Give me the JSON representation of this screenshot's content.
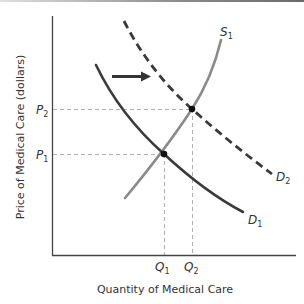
{
  "diagram": {
    "type": "supply-demand",
    "y_axis_label": "Price of Medical Care (dollars)",
    "x_axis_label": "Quantity of Medical Care",
    "price_labels": [
      {
        "base": "P",
        "sub": "2"
      },
      {
        "base": "P",
        "sub": "1"
      }
    ],
    "quantity_labels": [
      {
        "base": "Q",
        "sub": "1"
      },
      {
        "base": "Q",
        "sub": "2"
      }
    ],
    "curves": [
      {
        "name": "S",
        "sub": "1",
        "style": "solid",
        "color": "#8a8a8a"
      },
      {
        "name": "D",
        "sub": "1",
        "style": "solid",
        "color": "#3a3a3a"
      },
      {
        "name": "D",
        "sub": "2",
        "style": "dashed",
        "color": "#3a3a3a"
      }
    ],
    "shift_arrow": "right",
    "equilibria": [
      {
        "price": "P1",
        "quantity": "Q1"
      },
      {
        "price": "P2",
        "quantity": "Q2"
      }
    ]
  },
  "colors": {
    "axis": "#444444",
    "supply": "#8a8a8a",
    "demand": "#3a3a3a",
    "guides": "#9a9a9a"
  }
}
